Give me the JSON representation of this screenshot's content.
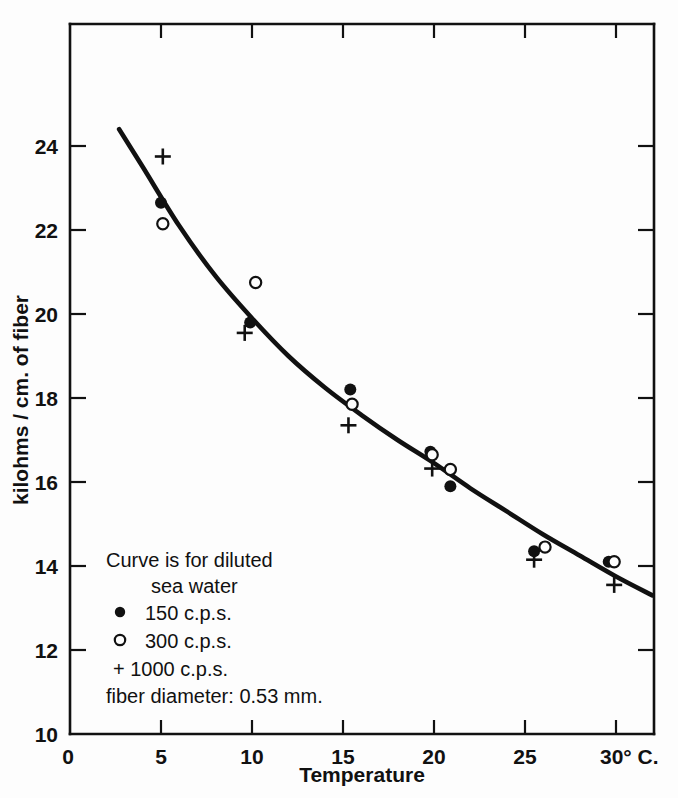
{
  "chart_data": {
    "type": "scatter",
    "title": "",
    "xlabel": "Temperature",
    "ylabel": "kilohms / cm. of fiber",
    "xlim": [
      0,
      32.5
    ],
    "ylim": [
      10,
      25.5
    ],
    "x_ticks": [
      "0",
      "5",
      "10",
      "15",
      "20",
      "25",
      "30° C."
    ],
    "x_tick_values": [
      0,
      5,
      10,
      15,
      20,
      25,
      30
    ],
    "y_ticks": [
      "10",
      "12",
      "14",
      "16",
      "18",
      "20",
      "22",
      "24"
    ],
    "y_tick_values": [
      10,
      12,
      14,
      16,
      18,
      20,
      22,
      24
    ],
    "grid": false,
    "legend_position": "lower-left-inside",
    "series": [
      {
        "name": "150 c.p.s.",
        "marker": "filled-circle",
        "points": [
          [
            5.0,
            22.65
          ],
          [
            9.9,
            19.8
          ],
          [
            15.4,
            18.2
          ],
          [
            19.8,
            16.72
          ],
          [
            20.9,
            15.9
          ],
          [
            25.5,
            14.35
          ],
          [
            29.6,
            14.1
          ]
        ]
      },
      {
        "name": "300 c.p.s.",
        "marker": "open-circle",
        "points": [
          [
            5.1,
            22.15
          ],
          [
            10.2,
            20.75
          ],
          [
            15.5,
            17.85
          ],
          [
            19.9,
            16.65
          ],
          [
            20.9,
            16.3
          ],
          [
            26.1,
            14.45
          ],
          [
            29.9,
            14.1
          ]
        ]
      },
      {
        "name": "1000 c.p.s.",
        "marker": "plus",
        "points": [
          [
            5.1,
            23.75
          ],
          [
            9.6,
            19.55
          ],
          [
            15.3,
            17.35
          ],
          [
            19.9,
            16.32
          ],
          [
            25.5,
            14.15
          ],
          [
            29.9,
            13.55
          ]
        ]
      }
    ],
    "curve": {
      "label": "Curve is for diluted sea water",
      "points": [
        [
          2.7,
          24.4
        ],
        [
          4.0,
          23.5
        ],
        [
          6.0,
          22.1
        ],
        [
          8.0,
          20.9
        ],
        [
          10.0,
          19.9
        ],
        [
          12.0,
          19.0
        ],
        [
          14.0,
          18.25
        ],
        [
          16.0,
          17.6
        ],
        [
          18.0,
          17.0
        ],
        [
          20.0,
          16.45
        ],
        [
          22.0,
          15.85
        ],
        [
          24.0,
          15.3
        ],
        [
          26.0,
          14.75
        ],
        [
          28.0,
          14.25
        ],
        [
          30.0,
          13.75
        ],
        [
          32.0,
          13.3
        ]
      ]
    }
  },
  "legend": {
    "line1": "Curve is for diluted",
    "line2": "sea water",
    "entry_150": "150 c.p.s.",
    "entry_300": "300 c.p.s.",
    "entry_1000": "+ 1000 c.p.s.",
    "footnote": "fiber diameter: 0.53 mm."
  },
  "axes": {
    "x_title": "Temperature",
    "y_title": "kilohms / cm. of fiber",
    "x_tick_0": "0",
    "x_tick_5": "5",
    "x_tick_10": "10",
    "x_tick_15": "15",
    "x_tick_20": "20",
    "x_tick_25": "25",
    "x_tick_30": "30° C.",
    "y_tick_10": "10",
    "y_tick_12": "12",
    "y_tick_14": "14",
    "y_tick_16": "16",
    "y_tick_18": "18",
    "y_tick_20": "20",
    "y_tick_22": "22",
    "y_tick_24": "24"
  },
  "colors": {
    "ink": "#111111",
    "paper": "#fdfdfd"
  }
}
